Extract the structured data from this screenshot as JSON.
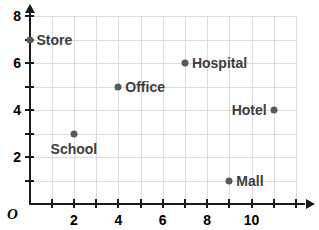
{
  "chart_data": {
    "type": "scatter",
    "title": "",
    "subtitle": "",
    "xlabel": "",
    "ylabel": "",
    "xlim": [
      0,
      12
    ],
    "ylim": [
      0,
      8
    ],
    "grid": true,
    "grid_step": 1,
    "legend": "none",
    "origin_label": "O",
    "x_ticks_labeled": [
      "2",
      "4",
      "6",
      "8",
      "10"
    ],
    "x_tick_values": [
      2,
      4,
      6,
      8,
      10
    ],
    "y_ticks_labeled": [
      "2",
      "4",
      "6",
      "8"
    ],
    "y_tick_values": [
      2,
      4,
      6,
      8
    ],
    "x_tick_step_minor": 1,
    "y_tick_step_minor": 1,
    "point_color": "#595959",
    "label_color": "#3d3d3d",
    "axis_color": "#1a1a1a",
    "grid_color": "#dcdcdc",
    "points": [
      {
        "name": "Store",
        "x": 0,
        "y": 7,
        "label_pos": "right"
      },
      {
        "name": "School",
        "x": 2,
        "y": 3,
        "label_pos": "below"
      },
      {
        "name": "Office",
        "x": 4,
        "y": 5,
        "label_pos": "right"
      },
      {
        "name": "Hospital",
        "x": 7,
        "y": 6,
        "label_pos": "right"
      },
      {
        "name": "Hotel",
        "x": 11,
        "y": 4,
        "label_pos": "left"
      },
      {
        "name": "Mall",
        "x": 9,
        "y": 1,
        "label_pos": "right"
      }
    ]
  }
}
